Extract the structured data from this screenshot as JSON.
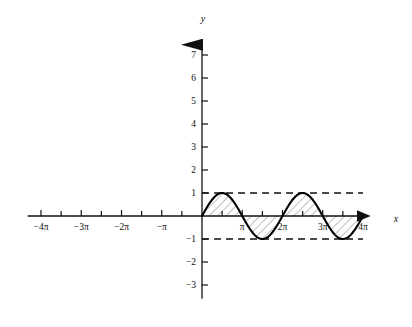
{
  "figure": {
    "axis_labels": {
      "x": "x",
      "y": "y"
    },
    "x_ticks_labeled": [
      {
        "label": "−4π",
        "value": -12.566
      },
      {
        "label": "−3π",
        "value": -9.425
      },
      {
        "label": "−2π",
        "value": -6.283
      },
      {
        "label": "−π",
        "value": -3.142
      },
      {
        "label": "π",
        "value": 3.142
      },
      {
        "label": "2π",
        "value": 6.283
      },
      {
        "label": "3π",
        "value": 9.425
      },
      {
        "label": "4π",
        "value": 12.566
      }
    ],
    "y_ticks_labeled": [
      {
        "label": "7",
        "value": 7
      },
      {
        "label": "6",
        "value": 6
      },
      {
        "label": "5",
        "value": 5
      },
      {
        "label": "4",
        "value": 4
      },
      {
        "label": "3",
        "value": 3
      },
      {
        "label": "2",
        "value": 2
      },
      {
        "label": "1",
        "value": 1
      },
      {
        "label": "−1",
        "value": -1
      },
      {
        "label": "−2",
        "value": -2
      },
      {
        "label": "−3",
        "value": -3
      }
    ],
    "colors": {
      "axis": "#111111",
      "curve": "#000000",
      "hatch": "#7a7a7a",
      "dashed": "#111111",
      "background": "#ffffff"
    }
  },
  "chart_data": {
    "type": "line",
    "title": "",
    "xlabel": "x",
    "ylabel": "y",
    "xlim": [
      -13.6,
      13.2
    ],
    "ylim": [
      -3.6,
      7.8
    ],
    "grid": false,
    "legend": "none",
    "function": "y = sin(x)",
    "curve_domain": [
      0,
      12.566
    ],
    "amplitude": 1,
    "period": 6.283,
    "x_tick_step_pi": 0.5,
    "annotations": [
      {
        "type": "dashed-line",
        "orientation": "horizontal",
        "y": 1,
        "x_from": 0,
        "x_to": 12.566
      },
      {
        "type": "dashed-line",
        "orientation": "horizontal",
        "y": -1,
        "x_from": 0,
        "x_to": 12.566
      },
      {
        "type": "hatched-region",
        "between": "curve and x-axis",
        "x_from": 0,
        "x_to": 12.566,
        "pattern": "diagonal-45"
      }
    ],
    "series": [
      {
        "name": "y = sin(x)",
        "x": [
          0,
          0.3927,
          0.7854,
          1.1781,
          1.5708,
          1.9635,
          2.3562,
          2.7489,
          3.1416,
          3.5343,
          3.927,
          4.3197,
          4.7124,
          5.1051,
          5.4978,
          5.8905,
          6.2832,
          6.6759,
          7.0686,
          7.4613,
          7.854,
          8.2467,
          8.6394,
          9.0321,
          9.4248,
          9.8175,
          10.2102,
          10.6029,
          10.9956,
          11.3883,
          11.781,
          12.1737,
          12.5664
        ],
        "y": [
          0,
          0.3827,
          0.7071,
          0.9239,
          1,
          0.9239,
          0.7071,
          0.3827,
          0,
          -0.3827,
          -0.7071,
          -0.9239,
          -1,
          -0.9239,
          -0.7071,
          -0.3827,
          0,
          0.3827,
          0.7071,
          0.9239,
          1,
          0.9239,
          0.7071,
          0.3827,
          0,
          -0.3827,
          -0.7071,
          -0.9239,
          -1,
          -0.9239,
          -0.7071,
          -0.3827,
          0
        ]
      }
    ]
  }
}
